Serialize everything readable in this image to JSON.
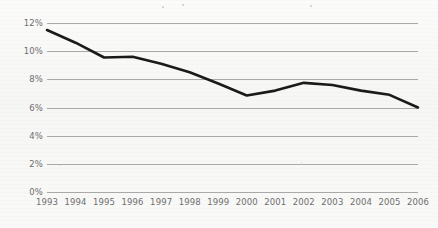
{
  "chart_data": {
    "type": "line",
    "title": "",
    "subtitle": "",
    "xlabel": "",
    "ylabel": "",
    "categories": [
      "1993",
      "1994",
      "1995",
      "1996",
      "1997",
      "1998",
      "1999",
      "2000",
      "2001",
      "2002",
      "2003",
      "2004",
      "2005",
      "2006"
    ],
    "values": [
      11.5,
      10.6,
      9.55,
      9.6,
      9.1,
      8.5,
      7.7,
      6.85,
      7.2,
      7.75,
      7.6,
      7.2,
      6.9,
      6.0
    ],
    "series": [
      {
        "name": "",
        "values": [
          11.5,
          10.6,
          9.55,
          9.6,
          9.1,
          8.5,
          7.7,
          6.85,
          7.2,
          7.75,
          7.6,
          7.2,
          6.9,
          6.0
        ]
      }
    ],
    "ylim": [
      0,
      12
    ],
    "y_ticks": [
      0,
      2,
      4,
      6,
      8,
      10,
      12
    ],
    "y_tick_labels": [
      "0%",
      "2%",
      "4%",
      "6%",
      "8%",
      "10%",
      "12%"
    ],
    "x_tick_labels": [
      "1993",
      "1994",
      "1995",
      "1996",
      "1997",
      "1998",
      "1999",
      "2000",
      "2001",
      "2002",
      "2003",
      "2004",
      "2005",
      "2006"
    ],
    "grid": true,
    "grid_axis": "y",
    "legend": false,
    "legend_position": "none",
    "annotations": [],
    "line_color": "#1a1a1a",
    "line_width": 2.6,
    "grid_color": "#a9a9a9",
    "tick_label_color": "#6e6e6e",
    "background_color": "#f8f8f7"
  },
  "colors": {
    "line": "#1a1a1a",
    "grid": "#a9a9a9",
    "tick_label": "#6e6e6e",
    "background": "#f8f8f7"
  }
}
